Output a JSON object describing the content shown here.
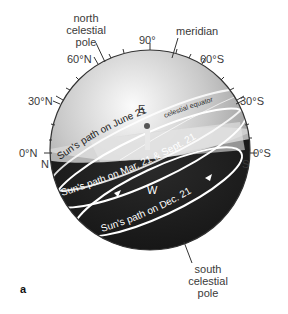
{
  "figure": {
    "panel_label": "a",
    "labels": {
      "north_pole": [
        "north",
        "celestial",
        "pole"
      ],
      "south_pole": [
        "south",
        "celestial",
        "pole"
      ],
      "meridian": "meridian",
      "zenith": "90°",
      "lat_60N": "60°N",
      "lat_30N": "30°N",
      "lat_0N": "0°N",
      "lat_60S": "60°S",
      "lat_30S": "30°S",
      "lat_0S": "0°S",
      "dir_N": "N",
      "dir_S": "S",
      "dir_E": "E",
      "dir_W": "W",
      "celestial_equator": "celestial equator",
      "path_june": "Sun's path on June 21",
      "path_equinox": "Sun's path on Mar. 21 & Sept. 21",
      "path_dec": "Sun's path on Dec. 21"
    },
    "colors": {
      "sky_light": "#f4f4f4",
      "sky_mid": "#b8b8b8",
      "sky_dark": "#8a8a8a",
      "below_horizon": "#1c1c1c",
      "path_line": "#ffffff",
      "outline": "#333333"
    }
  }
}
